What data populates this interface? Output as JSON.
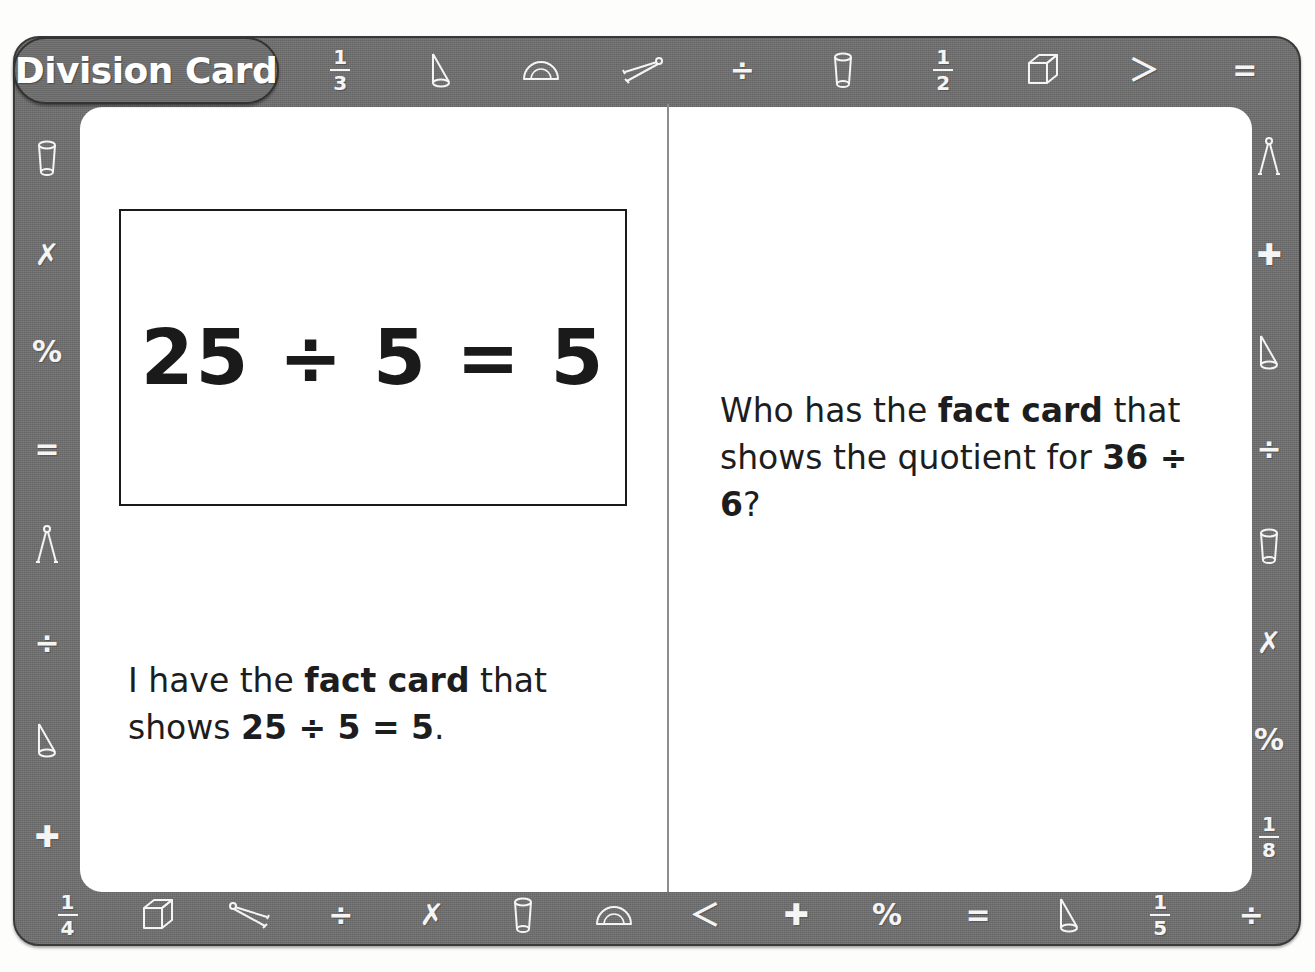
{
  "card": {
    "title": "Division Card",
    "type": "math-fact-card",
    "frame_color": "#6e6e6e",
    "card_background": "#ffffff",
    "text_color": "#1d1d1d"
  },
  "left_panel": {
    "equation_box": {
      "equation": "25 ÷ 5 = 5",
      "border_color": "#1a1a1a"
    },
    "statement": {
      "prefix": "I have the ",
      "bold_phrase": "fact card",
      "middle": " that shows ",
      "bold_equation": "25 ÷ 5 = 5",
      "suffix": "."
    }
  },
  "right_panel": {
    "question": {
      "prefix": "Who has the ",
      "bold_phrase": "fact card",
      "middle": " that shows the quotient for ",
      "bold_equation": "36 ÷ 6",
      "suffix": "?"
    }
  },
  "decorations": {
    "top_icons": [
      {
        "name": "fraction-one-third-icon",
        "kind": "fraction",
        "num": "1",
        "den": "3"
      },
      {
        "name": "set-square-triangle-icon",
        "kind": "triangle"
      },
      {
        "name": "protractor-icon",
        "kind": "protractor"
      },
      {
        "name": "compass-open-icon",
        "kind": "compass-flat"
      },
      {
        "name": "division-sign-icon",
        "kind": "glyph",
        "glyph": "÷"
      },
      {
        "name": "cylinder-icon",
        "kind": "cylinder"
      },
      {
        "name": "fraction-one-half-icon",
        "kind": "fraction",
        "num": "1",
        "den": "2"
      },
      {
        "name": "cube-icon",
        "kind": "cube"
      },
      {
        "name": "greater-than-icon",
        "kind": "glyph",
        "glyph": "＞"
      },
      {
        "name": "equals-sign-icon",
        "kind": "glyph",
        "glyph": "="
      }
    ],
    "left_icons": [
      {
        "name": "cylinder-icon",
        "kind": "cylinder"
      },
      {
        "name": "multiplication-sign-icon",
        "kind": "glyph",
        "glyph": "✗"
      },
      {
        "name": "percent-sign-icon",
        "kind": "glyph",
        "glyph": "%"
      },
      {
        "name": "equals-sign-icon",
        "kind": "glyph",
        "glyph": "="
      },
      {
        "name": "compass-icon",
        "kind": "compass"
      },
      {
        "name": "division-sign-icon",
        "kind": "glyph",
        "glyph": "÷"
      },
      {
        "name": "cone-icon",
        "kind": "cone"
      },
      {
        "name": "plus-sign-icon",
        "kind": "glyph",
        "glyph": "✚"
      }
    ],
    "right_icons": [
      {
        "name": "compass-icon",
        "kind": "compass"
      },
      {
        "name": "plus-sign-icon",
        "kind": "glyph",
        "glyph": "✚"
      },
      {
        "name": "cone-icon",
        "kind": "cone"
      },
      {
        "name": "division-sign-icon",
        "kind": "glyph",
        "glyph": "÷"
      },
      {
        "name": "cylinder-icon",
        "kind": "cylinder"
      },
      {
        "name": "multiplication-sign-icon",
        "kind": "glyph",
        "glyph": "✗"
      },
      {
        "name": "percent-sign-icon",
        "kind": "glyph",
        "glyph": "%"
      },
      {
        "name": "fraction-one-eighth-icon",
        "kind": "fraction",
        "num": "1",
        "den": "8"
      }
    ],
    "bottom_icons": [
      {
        "name": "fraction-one-quarter-icon",
        "kind": "fraction",
        "num": "1",
        "den": "4"
      },
      {
        "name": "cube-icon",
        "kind": "cube"
      },
      {
        "name": "compass-open-icon",
        "kind": "compass-flat-left"
      },
      {
        "name": "division-sign-icon",
        "kind": "glyph",
        "glyph": "÷"
      },
      {
        "name": "multiplication-sign-icon",
        "kind": "glyph",
        "glyph": "✗"
      },
      {
        "name": "cylinder-icon",
        "kind": "cylinder"
      },
      {
        "name": "protractor-icon",
        "kind": "protractor"
      },
      {
        "name": "less-than-icon",
        "kind": "glyph",
        "glyph": "＜"
      },
      {
        "name": "plus-sign-icon",
        "kind": "glyph",
        "glyph": "✚"
      },
      {
        "name": "percent-sign-icon",
        "kind": "glyph",
        "glyph": "%"
      },
      {
        "name": "equals-sign-icon",
        "kind": "glyph",
        "glyph": "="
      },
      {
        "name": "cone-icon",
        "kind": "cone"
      },
      {
        "name": "fraction-one-fifth-icon",
        "kind": "fraction",
        "num": "1",
        "den": "5"
      },
      {
        "name": "division-sign-icon",
        "kind": "glyph",
        "glyph": "÷"
      }
    ]
  }
}
